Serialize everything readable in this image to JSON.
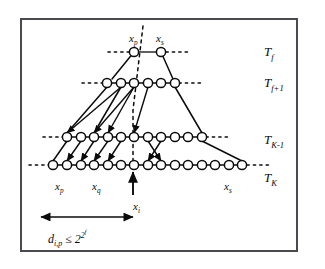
{
  "figure": {
    "kind": "hierarchical-tree-levels-diagram",
    "background": "#ffffff",
    "frame_color": "#4a4a52",
    "ink_color": "#0b0b0b"
  },
  "level_labels": [
    {
      "name": "level-label-tf",
      "base": "T",
      "sub": "f",
      "x": 264,
      "y": 45
    },
    {
      "name": "level-label-tf1",
      "base": "T",
      "sub": "f+1",
      "x": 264,
      "y": 76
    },
    {
      "name": "level-label-tk1",
      "base": "T",
      "sub": "K-1",
      "x": 264,
      "y": 133
    },
    {
      "name": "level-label-tk",
      "base": "T",
      "sub": "K",
      "x": 264,
      "y": 171
    }
  ],
  "node_labels": [
    {
      "name": "node-label-xp-top",
      "base": "x",
      "sub": "p",
      "x": 129,
      "y": 33
    },
    {
      "name": "node-label-xs-top",
      "base": "x",
      "sub": "s",
      "x": 156,
      "y": 33
    },
    {
      "name": "node-label-xp-bottom",
      "base": "x",
      "sub": "p",
      "x": 55,
      "y": 181
    },
    {
      "name": "node-label-xq-bottom",
      "base": "x",
      "sub": "q",
      "x": 92,
      "y": 181
    },
    {
      "name": "node-label-xs-bottom",
      "base": "x",
      "sub": "s",
      "x": 224,
      "y": 181
    },
    {
      "name": "node-label-xi-arrow",
      "base": "x",
      "sub": "i",
      "x": 133,
      "y": 201
    }
  ],
  "distance_annotation": {
    "name": "distance-constraint",
    "lhs_base": "d",
    "lhs_sub": "i,p",
    "relation": "≤",
    "rhs_base": "2",
    "rhs_exp_base": "2",
    "rhs_exp_exp": "f",
    "x": 48,
    "y": 230
  },
  "rows": [
    {
      "id": "Tf",
      "y": 52,
      "circle_r": 4.6,
      "nodes_x": [
        134,
        161
      ],
      "dash_left": [
        108,
        130
      ],
      "dash_right": [
        166,
        190
      ]
    },
    {
      "id": "Tf1",
      "y": 83,
      "circle_r": 4.6,
      "nodes_x": [
        107,
        121,
        134,
        148,
        161,
        175
      ],
      "dash_left": [
        82,
        103
      ],
      "dash_right": [
        179,
        202
      ]
    },
    {
      "id": "TK1",
      "y": 137,
      "circle_r": 4.6,
      "nodes_x": [
        67,
        81,
        94,
        108,
        121,
        134,
        148,
        161,
        175,
        188,
        202
      ],
      "dash_left": [
        43,
        63
      ],
      "dash_right": [
        206,
        230
      ]
    },
    {
      "id": "TK",
      "y": 165,
      "circle_r": 4.6,
      "nodes_x": [
        53,
        67,
        81,
        94,
        108,
        121,
        134,
        148,
        161,
        175,
        188,
        202,
        215,
        229,
        242
      ],
      "dash_left": [
        29,
        49
      ],
      "dash_right": [
        247,
        270
      ]
    }
  ],
  "trapezoid_edges": [
    {
      "name": "edge-tf-left-down",
      "from": [
        134,
        52
      ],
      "to": [
        112,
        79
      ]
    },
    {
      "name": "edge-tf-right-down",
      "from": [
        161,
        52
      ],
      "to": [
        173,
        79
      ]
    },
    {
      "name": "edge-tf1-left-long",
      "from": [
        107,
        87
      ],
      "to": [
        67,
        133
      ]
    },
    {
      "name": "edge-tf1-mid-long",
      "from": [
        121,
        87
      ],
      "to": [
        94,
        133
      ]
    },
    {
      "name": "edge-tf1-right-long",
      "from": [
        175,
        87
      ],
      "to": [
        202,
        133
      ]
    },
    {
      "name": "edge-tk1-left-down",
      "from": [
        67,
        141
      ],
      "to": [
        53,
        161
      ]
    },
    {
      "name": "edge-tk1-right-down",
      "from": [
        202,
        141
      ],
      "to": [
        242,
        161
      ]
    }
  ],
  "descent_arrows": [
    {
      "name": "arrow-down-a",
      "from": [
        121,
        87
      ],
      "to": [
        67,
        133
      ]
    },
    {
      "name": "arrow-down-b",
      "from": [
        134,
        87
      ],
      "to": [
        94,
        133
      ]
    },
    {
      "name": "arrow-down-c",
      "from": [
        134,
        87
      ],
      "to": [
        108,
        133
      ]
    },
    {
      "name": "arrow-down-d",
      "from": [
        148,
        87
      ],
      "to": [
        134,
        133
      ]
    },
    {
      "name": "arrow-down-e",
      "from": [
        81,
        141
      ],
      "to": [
        67,
        161
      ]
    },
    {
      "name": "arrow-down-f",
      "from": [
        94,
        141
      ],
      "to": [
        81,
        161
      ]
    },
    {
      "name": "arrow-down-g",
      "from": [
        108,
        141
      ],
      "to": [
        94,
        161
      ]
    },
    {
      "name": "arrow-down-h",
      "from": [
        121,
        141
      ],
      "to": [
        108,
        161
      ]
    },
    {
      "name": "arrow-down-i",
      "from": [
        148,
        141
      ],
      "to": [
        161,
        161
      ]
    },
    {
      "name": "arrow-down-j",
      "from": [
        161,
        141
      ],
      "to": [
        148,
        161
      ]
    }
  ],
  "dotted_vertical": {
    "name": "dotted-vertical-guide",
    "points": [
      [
        143,
        26
      ],
      [
        133,
        110
      ],
      [
        133,
        160
      ]
    ]
  },
  "pointer_arrow": {
    "name": "xi-pointer-arrow",
    "from": [
      133,
      195
    ],
    "to": [
      133,
      172
    ]
  },
  "distance_arrow": {
    "name": "distance-span-arrow",
    "from": [
      41,
      217
    ],
    "to": [
      133,
      217
    ]
  }
}
